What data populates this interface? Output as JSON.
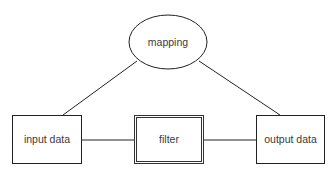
{
  "diagram": {
    "type": "block-diagram",
    "nodes": {
      "mapping": {
        "label": "mapping",
        "shape": "ellipse"
      },
      "input": {
        "label": "input data",
        "shape": "rectangle"
      },
      "filter": {
        "label": "filter",
        "shape": "double-rectangle"
      },
      "output": {
        "label": "output data",
        "shape": "rectangle"
      }
    },
    "edges": [
      {
        "from": "mapping",
        "to": "input"
      },
      {
        "from": "mapping",
        "to": "output"
      },
      {
        "from": "input",
        "to": "filter"
      },
      {
        "from": "filter",
        "to": "output"
      }
    ],
    "colors": {
      "stroke": "#222222",
      "text": "#3a3a3a",
      "background": "#ffffff"
    }
  }
}
